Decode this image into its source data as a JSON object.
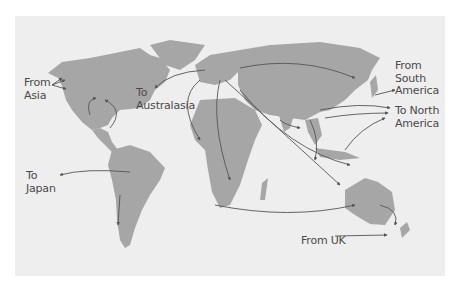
{
  "map": {
    "title": "World migration flows",
    "colors": {
      "ocean": "#eeeeee",
      "land": "#a6a6a6",
      "arrow": "#555555",
      "label": "#4a4a4a"
    },
    "labels": [
      {
        "id": "from-asia",
        "text": "From\nAsia"
      },
      {
        "id": "to-australasia",
        "text": "To\nAustralasia"
      },
      {
        "id": "from-south-america",
        "text": "From\nSouth\nAmerica"
      },
      {
        "id": "to-north-america",
        "text": "To North\nAmerica"
      },
      {
        "id": "to-japan",
        "text": "To\nJapan"
      },
      {
        "id": "from-uk",
        "text": "From UK"
      }
    ]
  }
}
